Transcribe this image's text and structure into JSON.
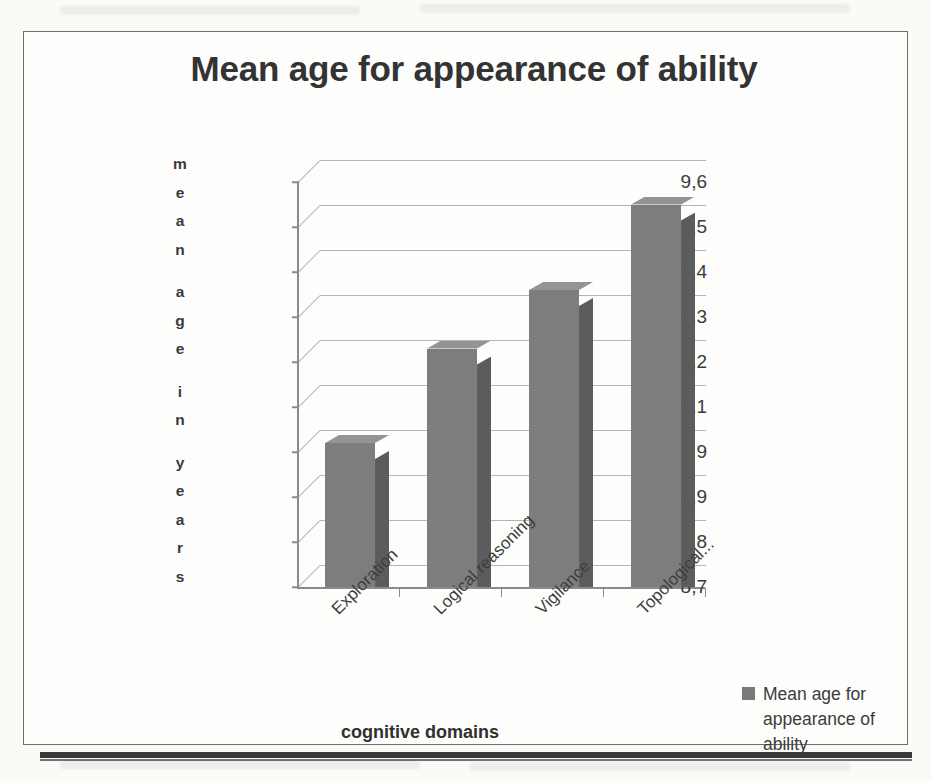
{
  "chart_data": {
    "type": "bar",
    "title": "Mean age for appearance of ability",
    "xlabel": "cognitive domains",
    "ylabel": "mean age in years",
    "ylabel_letters": [
      "m",
      "e",
      "a",
      "n",
      "",
      "a",
      "g",
      "e",
      "",
      "i",
      "n",
      "",
      "y",
      "e",
      "a",
      "r",
      "s"
    ],
    "categories": [
      "Exploration",
      "Logical reasoning",
      "Vigilance",
      "Topological..."
    ],
    "values": [
      9.02,
      9.23,
      9.36,
      9.55
    ],
    "series": [
      {
        "name": "Mean age for appearance of ability",
        "values": [
          9.02,
          9.23,
          9.36,
          9.55
        ]
      }
    ],
    "ylim": [
      8.7,
      9.6
    ],
    "ytick_labels": [
      "9,6",
      "9,5",
      "9,4",
      "9,3",
      "9,2",
      "9,1",
      "9",
      "8,9",
      "8,8",
      "8,7"
    ],
    "ytick_values": [
      9.6,
      9.5,
      9.4,
      9.3,
      9.2,
      9.1,
      9.0,
      8.9,
      8.8,
      8.7
    ],
    "grid": true,
    "legend_position": "right",
    "legend_entries": [
      "Mean age for appearance of ability"
    ],
    "style": "3d-column",
    "colors": {
      "bar_front": "#7d7d7d",
      "bar_side": "#5c5c5c",
      "bar_top": "#949494",
      "gridline": "#b4b4b4",
      "axis": "#8a8a8a",
      "title_text": "#333333",
      "frame_border": "#6d6d6d"
    }
  },
  "legend": {
    "label": "Mean age for appearance of ability",
    "marker_icon": "legend-square-icon"
  }
}
